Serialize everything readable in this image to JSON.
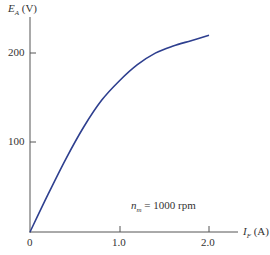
{
  "chart_data": {
    "type": "line",
    "title": "",
    "xlabel": "I_F (A)",
    "ylabel": "E_A (V)",
    "x": [
      0,
      0.2,
      0.4,
      0.6,
      0.8,
      1.0,
      1.2,
      1.4,
      1.6,
      1.8,
      2.0
    ],
    "series": [
      {
        "name": "n_m = 1000 rpm",
        "values": [
          0,
          42,
          82,
          118,
          148,
          170,
          188,
          201,
          209,
          215,
          221
        ]
      }
    ],
    "xlim": [
      0,
      2.2
    ],
    "ylim": [
      0,
      230
    ],
    "xticks": [
      "0",
      "1.0",
      "2.0"
    ],
    "yticks": [
      "100",
      "200"
    ],
    "grid": false,
    "annotations": [
      "n_m = 1000 rpm"
    ],
    "line_color": "#2e3f8f"
  },
  "labels": {
    "y_main": "E",
    "y_sub": "A",
    "y_unit": " (V)",
    "x_main": "I",
    "x_sub": "F",
    "x_unit": " (A)",
    "ann_main": "n",
    "ann_sub": "m",
    "ann_rest": " = 1000 rpm",
    "tick_x0": "0",
    "tick_x1": "1.0",
    "tick_x2": "2.0",
    "tick_y100": "100",
    "tick_y200": "200"
  }
}
